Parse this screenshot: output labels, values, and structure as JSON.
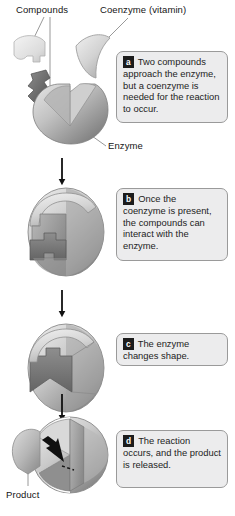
{
  "figure": {
    "background_color": "#ffffff"
  },
  "labels": {
    "compounds": "Compounds",
    "coenzyme": "Coenzyme (vitamin)",
    "enzyme": "Enzyme",
    "product": "Product"
  },
  "steps": [
    {
      "letter": "a",
      "text": "Two compounds approach the enzyme, but a coenzyme is needed for the reaction to occur."
    },
    {
      "letter": "b",
      "text": "Once the coenzyme is present, the compounds can interact with the enzyme."
    },
    {
      "letter": "c",
      "text": "The enzyme changes shape."
    },
    {
      "letter": "d",
      "text": "The reaction occurs, and the product is released."
    }
  ],
  "colors": {
    "badge_background": "#1c1c1c",
    "badge_text": "#ffffff",
    "callout_background": "#ececed",
    "callout_border": "#9a9a9a",
    "arrow": "#111111",
    "enzyme_light": "#d7d7d7",
    "enzyme_mid": "#a8a8a8",
    "enzyme_dark": "#6f6f6f",
    "coenzyme_fill": "#cfcfcf",
    "compound_dark": "#6a6a6a",
    "compound_light": "#e3e3e3",
    "leader_line": "#8a8a8a"
  },
  "arrows": {
    "count": 3,
    "direction": "down"
  }
}
